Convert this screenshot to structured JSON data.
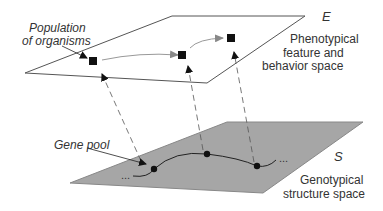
{
  "diagram": {
    "upper_plane": {
      "symbol": "E",
      "label_lines": [
        "Phenotypical",
        "feature and",
        "behavior space"
      ],
      "fill": "#ffffff",
      "stroke": "#555555"
    },
    "lower_plane": {
      "symbol": "S",
      "label_lines": [
        "Genotypical",
        "structure space"
      ],
      "fill": "#a6a6a6",
      "stroke": "#777777"
    },
    "annotations": {
      "population": [
        "Population",
        "of organisms"
      ],
      "gene_pool": "Gene pool"
    },
    "phenotype_nodes": 3,
    "genotype_nodes": 3,
    "ellipsis": "..."
  }
}
